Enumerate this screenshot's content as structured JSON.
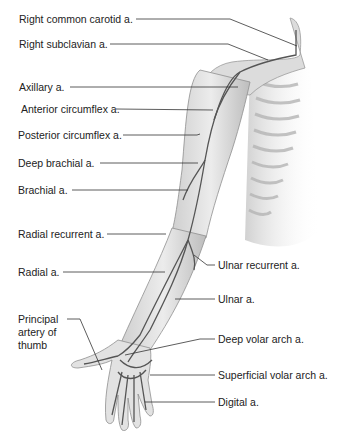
{
  "figure": {
    "left_labels": [
      {
        "text": "Right common carotid a.",
        "x": 19,
        "y": 13
      },
      {
        "text": "Right subclavian a.",
        "x": 19,
        "y": 38
      },
      {
        "text": "Axillary a.",
        "x": 19,
        "y": 81
      },
      {
        "text": "Anterior circumflex a.",
        "x": 21,
        "y": 103
      },
      {
        "text": "Posterior circumflex a.",
        "x": 18,
        "y": 129
      },
      {
        "text": "Deep brachial a.",
        "x": 18,
        "y": 157
      },
      {
        "text": "Brachial a.",
        "x": 18,
        "y": 184
      },
      {
        "text": "Radial recurrent a.",
        "x": 18,
        "y": 228
      },
      {
        "text": "Radial a.",
        "x": 18,
        "y": 266
      }
    ],
    "principal_label": {
      "line1": "Principal",
      "line2": "artery of",
      "line3": "thumb",
      "x": 18,
      "y": 313
    },
    "right_labels": [
      {
        "text": "Ulnar recurrent a.",
        "x": 218,
        "y": 259
      },
      {
        "text": "Ulnar a.",
        "x": 218,
        "y": 293
      },
      {
        "text": "Deep volar arch a.",
        "x": 218,
        "y": 333
      },
      {
        "text": "Superficial volar arch a.",
        "x": 218,
        "y": 369
      },
      {
        "text": "Digital a.",
        "x": 218,
        "y": 396
      }
    ],
    "colors": {
      "label_text": "#222222",
      "leader_line": "#333333",
      "limb_fill": "#d9d9d9",
      "limb_shade": "#a8a8a8",
      "artery": "#555555"
    }
  }
}
